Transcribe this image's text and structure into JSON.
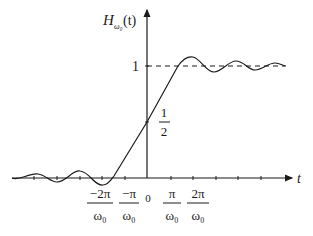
{
  "figure": {
    "y_axis_label_main": "H",
    "y_axis_label_sub": "ω₀",
    "y_axis_label_arg": "(t)",
    "x_axis_label": "t",
    "level_one_label": "1",
    "half_label_num": "1",
    "half_label_den": "2",
    "origin_label": "0",
    "ticks": [
      {
        "num": "−2π",
        "den": "ω₀"
      },
      {
        "num": "−π",
        "den": "ω₀"
      },
      {
        "num": "π",
        "den": "ω₀"
      },
      {
        "num": "2π",
        "den": "ω₀"
      }
    ]
  },
  "colors": {
    "ink": "#1a1a1a",
    "background": "#ffffff"
  }
}
